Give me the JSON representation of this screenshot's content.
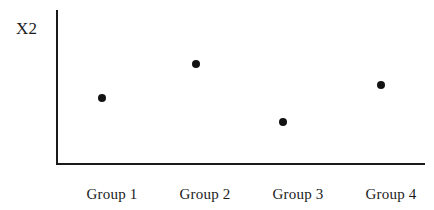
{
  "chart_data": {
    "type": "scatter",
    "title": "",
    "subtitle": "",
    "xlabel": "",
    "ylabel": "X2",
    "categories": [
      "Group 1",
      "Group 2",
      "Group 3",
      "Group 4"
    ],
    "values": [
      0.43,
      0.65,
      0.27,
      0.51
    ],
    "series": [
      {
        "name": "X2",
        "values": [
          0.43,
          0.65,
          0.27,
          0.51
        ]
      }
    ],
    "points": [
      {
        "category": "Group 1",
        "value": 0.43,
        "x_px": 102,
        "y_px": 98
      },
      {
        "category": "Group 2",
        "value": 0.65,
        "x_px": 196,
        "y_px": 64
      },
      {
        "category": "Group 3",
        "value": 0.27,
        "x_px": 283,
        "y_px": 122
      },
      {
        "category": "Group 4",
        "value": 0.51,
        "x_px": 381,
        "y_px": 85
      }
    ],
    "ylim": [
      0,
      1
    ],
    "y_axis_ticks": [],
    "x_axis_ticks": [
      "Group 1",
      "Group 2",
      "Group 3",
      "Group 4"
    ],
    "grid": false,
    "legend": false,
    "legend_position": "none",
    "annotations": [],
    "marker": "filled-circle",
    "marker_color": "#131313",
    "axis_color": "#1a1a1a",
    "background_color": "#ffffff"
  },
  "axis": {
    "y_label": "X2"
  },
  "labels": {
    "group_1": "Group 1",
    "group_2": "Group 2",
    "group_3": "Group 3",
    "group_4": "Group 4"
  }
}
